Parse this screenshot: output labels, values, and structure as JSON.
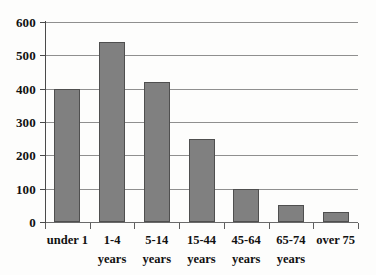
{
  "chart_data": {
    "type": "bar",
    "title": "",
    "subtitle": "",
    "xlabel": "",
    "ylabel": "",
    "ylim": [
      0,
      600
    ],
    "ytick_step": 100,
    "yticks": [
      600,
      500,
      400,
      300,
      200,
      100,
      0
    ],
    "ytick_labels": [
      "600",
      "500",
      "400",
      "300",
      "200",
      "100",
      "0"
    ],
    "grid": true,
    "legend": "none",
    "categories": [
      "under 1",
      "1-4 years",
      "5-14 years",
      "15-44 years",
      "45-64 years",
      "65-74 years",
      "over 75"
    ],
    "category_lines": [
      [
        "under 1",
        ""
      ],
      [
        "1-4",
        "years"
      ],
      [
        "5-14",
        "years"
      ],
      [
        "15-44",
        "years"
      ],
      [
        "45-64",
        "years"
      ],
      [
        "65-74",
        "years"
      ],
      [
        "over 75",
        ""
      ]
    ],
    "values": [
      400,
      540,
      420,
      250,
      100,
      50,
      30
    ],
    "colors": {
      "bar_fill": "#808080",
      "bar_border": "#4f4f4f",
      "gridline": "#8f8f8f",
      "axis": "#4a4a4a",
      "text": "#111111",
      "background": "#fdfdfc"
    }
  }
}
